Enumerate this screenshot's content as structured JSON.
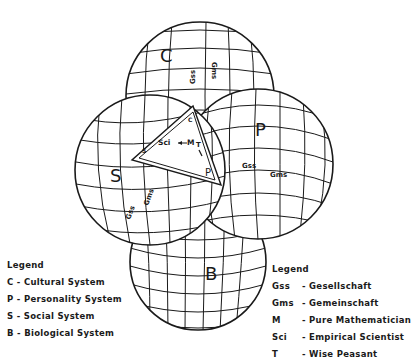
{
  "diagram": {
    "spheres": [
      {
        "id": "C",
        "label": "C",
        "gss": "Gss",
        "gms": "Gms"
      },
      {
        "id": "P",
        "label": "P",
        "gss": "Gss",
        "gms": "Gms"
      },
      {
        "id": "S",
        "label": "S",
        "gss": "Gss",
        "gms": "Gms"
      },
      {
        "id": "B",
        "label": "B"
      }
    ],
    "triangle": {
      "vertex_top": "C",
      "vertex_left": "S",
      "vertex_right": "P",
      "sci": "Sci",
      "m": "M",
      "t": "T"
    }
  },
  "legend_systems": {
    "title": "Legend",
    "items": [
      {
        "key": "C",
        "sep": "-",
        "text": "Cultural System"
      },
      {
        "key": "P",
        "sep": "-",
        "text": "Personality System"
      },
      {
        "key": "S",
        "sep": "-",
        "text": "Social System"
      },
      {
        "key": "B",
        "sep": "-",
        "text": "Biological System"
      }
    ]
  },
  "legend_terms": {
    "title": "Legend",
    "items": [
      {
        "key": "Gss",
        "sep": "-",
        "text": "Gesellschaft"
      },
      {
        "key": "Gms",
        "sep": "-",
        "text": "Gemeinschaft"
      },
      {
        "key": "M",
        "sep": "-",
        "text": "Pure Mathematician"
      },
      {
        "key": "Sci",
        "sep": "-",
        "text": "Empirical Scientist"
      },
      {
        "key": "T",
        "sep": "-",
        "text": "Wise Peasant"
      }
    ]
  }
}
